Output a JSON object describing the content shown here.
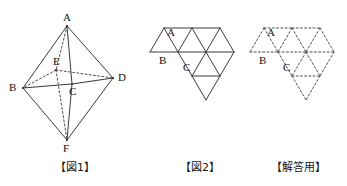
{
  "page": {
    "background_color": "#ffffff",
    "line_color": "#3a3a3a",
    "text_color": "#101010",
    "width": 347,
    "height": 186
  },
  "figures": [
    {
      "id": "fig1",
      "caption": "【図1】",
      "kind": "octahedron-solid",
      "description": "Regular octahedron drawn in oblique projection with hidden edges dashed",
      "vertices": [
        {
          "name": "A",
          "x": 67,
          "y": 26,
          "label_dx": -4,
          "label_dy": -14,
          "hidden": false
        },
        {
          "name": "B",
          "x": 23,
          "y": 88,
          "label_dx": -14,
          "label_dy": -6,
          "hidden": false
        },
        {
          "name": "C",
          "x": 72,
          "y": 84,
          "label_dx": -3,
          "label_dy": 2,
          "hidden": false
        },
        {
          "name": "D",
          "x": 113,
          "y": 78,
          "label_dx": 5,
          "label_dy": -6,
          "hidden": false
        },
        {
          "name": "E",
          "x": 56,
          "y": 70,
          "label_dx": -3,
          "label_dy": -14,
          "hidden": true
        },
        {
          "name": "F",
          "x": 67,
          "y": 140,
          "label_dx": -4,
          "label_dy": 3,
          "hidden": false
        }
      ],
      "solid_edges": [
        [
          "A",
          "B"
        ],
        [
          "A",
          "D"
        ],
        [
          "A",
          "C"
        ],
        [
          "B",
          "C"
        ],
        [
          "C",
          "D"
        ],
        [
          "B",
          "F"
        ],
        [
          "D",
          "F"
        ],
        [
          "C",
          "F"
        ]
      ],
      "dashed_edges": [
        [
          "A",
          "E"
        ],
        [
          "E",
          "B"
        ],
        [
          "E",
          "D"
        ],
        [
          "E",
          "F"
        ]
      ]
    },
    {
      "id": "fig2",
      "caption": "【図2】",
      "kind": "octahedron-net",
      "line_style": "solid",
      "description": "Net of the octahedron: eight equilateral triangles in a zig-zag strip",
      "labels": [
        {
          "name": "A",
          "x": 17,
          "y": 27
        },
        {
          "name": "B",
          "x": 9,
          "y": 55
        },
        {
          "name": "C",
          "x": 33,
          "y": 62
        }
      ]
    },
    {
      "id": "fig3",
      "caption": "【解答用】",
      "kind": "octahedron-net",
      "line_style": "dashed",
      "description": "Answer-sheet copy of the same net drawn entirely with dotted lines",
      "labels": [
        {
          "name": "A",
          "x": 17,
          "y": 27
        },
        {
          "name": "B",
          "x": 9,
          "y": 55
        },
        {
          "name": "C",
          "x": 33,
          "y": 62
        }
      ]
    }
  ],
  "net_geometry": {
    "origin_x": 14,
    "origin_y": 28,
    "side": 28,
    "row_height": 24,
    "nodes": {
      "p0": {
        "x": 14,
        "y": 28
      },
      "p1": {
        "x": 42,
        "y": 28
      },
      "p2": {
        "x": 70,
        "y": 28
      },
      "q0": {
        "x": 0,
        "y": 52
      },
      "q1": {
        "x": 28,
        "y": 52
      },
      "q2": {
        "x": 56,
        "y": 52
      },
      "q3": {
        "x": 84,
        "y": 52
      },
      "r1": {
        "x": 42,
        "y": 76
      },
      "r2": {
        "x": 70,
        "y": 76
      },
      "s2": {
        "x": 56,
        "y": 100
      }
    },
    "segments": [
      [
        "p0",
        "p1"
      ],
      [
        "p1",
        "p2"
      ],
      [
        "q0",
        "q1"
      ],
      [
        "q1",
        "q2"
      ],
      [
        "q2",
        "q3"
      ],
      [
        "r1",
        "r2"
      ],
      [
        "p0",
        "q0"
      ],
      [
        "p0",
        "q1"
      ],
      [
        "p1",
        "q1"
      ],
      [
        "p1",
        "q2"
      ],
      [
        "p2",
        "q2"
      ],
      [
        "p2",
        "q3"
      ],
      [
        "q1",
        "r1"
      ],
      [
        "q2",
        "r1"
      ],
      [
        "q2",
        "r2"
      ],
      [
        "q3",
        "r2"
      ],
      [
        "r1",
        "s2"
      ],
      [
        "r2",
        "s2"
      ]
    ]
  }
}
